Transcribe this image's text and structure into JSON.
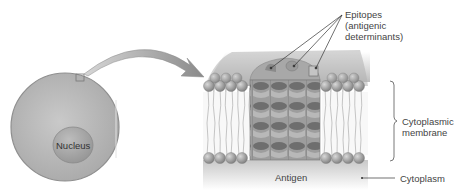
{
  "diagram": {
    "cell": {
      "nucleus_label": "Nucleus"
    },
    "labels": {
      "epitopes_line1": "Epitopes",
      "epitopes_line2": "(antigenic",
      "epitopes_line3": "determinants)",
      "membrane_line1": "Cytoplasmic",
      "membrane_line2": "membrane",
      "antigen": "Antigen",
      "cytoplasm": "Cytoplasm"
    },
    "colors": {
      "cell_fill": "#b8b8b8",
      "nucleus_fill": "#a6a6a6",
      "membrane_head": "#9a9a9a",
      "antigen_fill": "#8c8c8c",
      "text": "#444444"
    }
  }
}
